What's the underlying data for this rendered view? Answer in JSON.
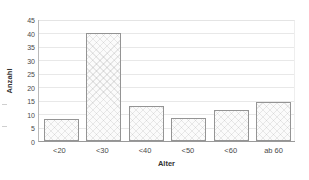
{
  "chart_data": {
    "type": "bar",
    "title": "",
    "subtitle": "",
    "xlabel": "Alter",
    "ylabel": "Anzahl",
    "categories": [
      "<20",
      "<30",
      "<40",
      "<50",
      "<60",
      "ab 60"
    ],
    "values": [
      8,
      40,
      13,
      8.5,
      11.5,
      14.5
    ],
    "ylim": [
      0,
      45
    ],
    "ytick_step": 5,
    "yticks": [
      45,
      40,
      35,
      30,
      25,
      20,
      15,
      10,
      5,
      0
    ],
    "grid": true,
    "legend": "none",
    "series": [
      {
        "name": "Anzahl",
        "values": [
          8,
          40,
          13,
          8.5,
          11.5,
          14.5
        ]
      }
    ],
    "colors": {
      "bar_fill": "#fbfbfb",
      "bar_border": "#949494",
      "gridline": "#e8e8e8",
      "axis": "#9a9a9a",
      "text": "#4a4a4a"
    }
  }
}
